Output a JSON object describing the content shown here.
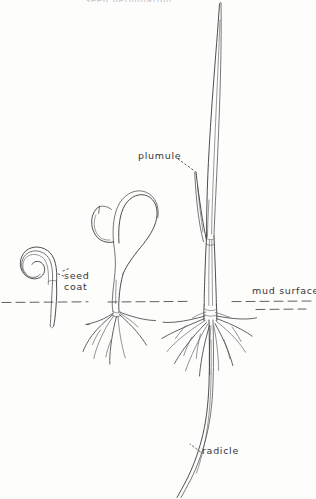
{
  "figure": {
    "title_fragment": "seed germination",
    "background_color": "#fdfdfc",
    "ink_color": "#3a3a3c"
  },
  "labels": {
    "seed_coat": "seed coat",
    "seed_coat_line1": "seed",
    "seed_coat_line2": "coat",
    "plumule": "plumule",
    "mud_surface": "mud surface",
    "radicle": "radicle"
  },
  "stages": [
    {
      "name": "stage-1-coiled-seed",
      "description": "coiled seed with hooked embryo and short radicle stub"
    },
    {
      "name": "stage-2-hooked-seedling",
      "description": "elongating hooked shoot emerging from split seed coat with fibrous roots"
    },
    {
      "name": "stage-3-established-seedling",
      "description": "tall erect seedling with two leaf blades, root crown and long radicle"
    }
  ],
  "ground": {
    "label": "mud surface",
    "y": 302
  }
}
